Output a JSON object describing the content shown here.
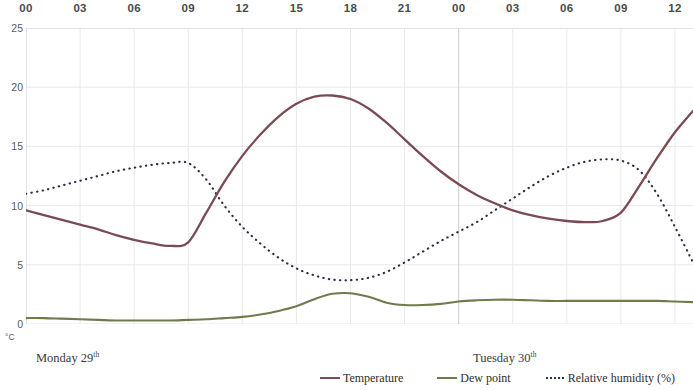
{
  "axes": {
    "y_unit_label": "°C",
    "y_ticks": [
      "25",
      "20",
      "15",
      "10",
      "5",
      "0"
    ],
    "x_ticks": [
      "00",
      "03",
      "06",
      "09",
      "12",
      "15",
      "18",
      "21",
      "00",
      "03",
      "06",
      "09",
      "12"
    ]
  },
  "days": {
    "day1_name": "Monday 29",
    "day1_suffix": "th",
    "day2_name": "Tuesday 30",
    "day2_suffix": "th"
  },
  "legend": {
    "temperature_label": "Temperature",
    "dewpoint_label": "Dew point",
    "humidity_label": "Relative  humidity (%)"
  },
  "colors": {
    "temperature": "#7a4b53",
    "dewpoint": "#6e7c4c",
    "humidity": "#2b2f4a",
    "gridline": "#e9e9ec",
    "axis": "#d2d2d6",
    "text": "#3a3a3a"
  },
  "chart_data": {
    "type": "line",
    "title": "",
    "xlabel": "",
    "ylabel": "°C",
    "ylim": [
      0,
      25
    ],
    "grid": true,
    "legend_position": "bottom-right",
    "x_tick_labels": [
      "00",
      "03",
      "06",
      "09",
      "12",
      "15",
      "18",
      "21",
      "00",
      "03",
      "06",
      "09",
      "12"
    ],
    "x_tick_hours": [
      0,
      3,
      6,
      9,
      12,
      15,
      18,
      21,
      24,
      27,
      30,
      33,
      36
    ],
    "x_range_hours": [
      0,
      37
    ],
    "day_dividers": [
      {
        "label": "Monday 29th",
        "start_hour": 0
      },
      {
        "label": "Tuesday 30th",
        "start_hour": 24
      }
    ],
    "series": [
      {
        "name": "Temperature",
        "unit": "°C",
        "color": "#7a4b53",
        "style": "solid",
        "x": [
          0,
          1,
          2,
          3,
          4,
          5,
          6,
          7,
          8,
          9,
          10,
          11,
          12,
          13,
          14,
          15,
          16,
          17,
          18,
          19,
          20,
          21,
          22,
          23,
          24,
          25,
          26,
          27,
          28,
          29,
          30,
          31,
          32,
          33,
          34,
          35,
          36,
          37
        ],
        "values": [
          9.6,
          9.2,
          8.8,
          8.4,
          8.0,
          7.5,
          7.1,
          6.8,
          6.6,
          6.9,
          9.4,
          12.0,
          14.2,
          16.0,
          17.5,
          18.6,
          19.2,
          19.3,
          19.0,
          18.2,
          17.0,
          15.6,
          14.2,
          12.9,
          11.8,
          10.9,
          10.2,
          9.6,
          9.2,
          8.9,
          8.7,
          8.6,
          8.7,
          9.4,
          11.6,
          14.0,
          16.2,
          18.0
        ]
      },
      {
        "name": "Dew point",
        "unit": "°C",
        "color": "#6e7c4c",
        "style": "solid",
        "x": [
          0,
          1,
          2,
          3,
          4,
          5,
          6,
          7,
          8,
          9,
          10,
          11,
          12,
          13,
          14,
          15,
          16,
          17,
          18,
          19,
          20,
          21,
          22,
          23,
          24,
          25,
          26,
          27,
          28,
          29,
          30,
          31,
          32,
          33,
          34,
          35,
          36,
          37
        ],
        "values": [
          0.5,
          0.5,
          0.45,
          0.4,
          0.35,
          0.3,
          0.3,
          0.3,
          0.3,
          0.35,
          0.4,
          0.5,
          0.6,
          0.8,
          1.1,
          1.5,
          2.1,
          2.55,
          2.6,
          2.3,
          1.8,
          1.6,
          1.6,
          1.7,
          1.9,
          2.0,
          2.05,
          2.05,
          2.0,
          1.95,
          1.95,
          1.95,
          1.95,
          1.95,
          1.95,
          1.95,
          1.9,
          1.85
        ]
      },
      {
        "name": "Relative humidity (%)",
        "unit": "%",
        "color": "#2b2f4a",
        "style": "dotted",
        "note": "plotted on the same vertical scale as shown in the figure",
        "x": [
          0,
          1,
          2,
          3,
          4,
          5,
          6,
          7,
          8,
          9,
          10,
          11,
          12,
          13,
          14,
          15,
          16,
          17,
          18,
          19,
          20,
          21,
          22,
          23,
          24,
          25,
          26,
          27,
          28,
          29,
          30,
          31,
          32,
          33,
          34,
          35,
          36,
          37
        ],
        "values": [
          11.0,
          11.3,
          11.7,
          12.1,
          12.5,
          12.9,
          13.2,
          13.45,
          13.6,
          13.6,
          12.2,
          10.0,
          8.2,
          6.8,
          5.6,
          4.7,
          4.1,
          3.75,
          3.7,
          3.9,
          4.4,
          5.2,
          6.1,
          7.0,
          7.8,
          8.6,
          9.6,
          10.6,
          11.6,
          12.5,
          13.2,
          13.7,
          13.9,
          13.8,
          13.0,
          11.0,
          8.2,
          5.2
        ]
      }
    ]
  }
}
